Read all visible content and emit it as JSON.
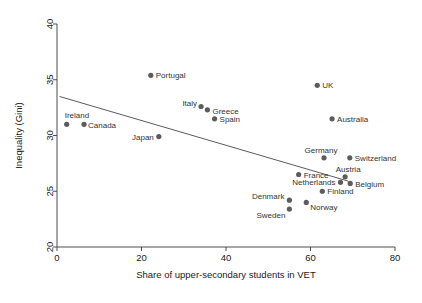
{
  "chart_data": {
    "type": "scatter",
    "title": "",
    "xlabel": "Share of upper-secondary students in VET",
    "ylabel": "Inequality (Gini)",
    "xlim": [
      0,
      80
    ],
    "ylim": [
      20,
      40
    ],
    "xticks": [
      0,
      20,
      40,
      60,
      80
    ],
    "yticks": [
      20,
      25,
      30,
      35,
      40
    ],
    "grid": false,
    "legend": "none",
    "point_color": "#5c5c5c",
    "line_color": "#5a5a5a",
    "trendline": {
      "x1": 0.6,
      "y1": 33.5,
      "x2": 69.0,
      "y2": 25.9
    },
    "points": [
      {
        "name": "Ireland",
        "x": 2.3,
        "y": 31.0,
        "label_dx": -2,
        "label_dy": -6,
        "anchor": "start"
      },
      {
        "name": "Canada",
        "x": 6.4,
        "y": 31.0,
        "label_dx": 4,
        "label_dy": 4,
        "anchor": "start"
      },
      {
        "name": "Portugal",
        "x": 22.2,
        "y": 35.4,
        "label_dx": 5,
        "label_dy": 3,
        "anchor": "start"
      },
      {
        "name": "Japan",
        "x": 24.1,
        "y": 29.9,
        "label_dx": -5,
        "label_dy": 3,
        "anchor": "end"
      },
      {
        "name": "Italy",
        "x": 34.1,
        "y": 32.6,
        "label_dx": -4,
        "label_dy": -1,
        "anchor": "end"
      },
      {
        "name": "Greece",
        "x": 35.6,
        "y": 32.3,
        "label_dx": 5,
        "label_dy": 4,
        "anchor": "start"
      },
      {
        "name": "Spain",
        "x": 37.3,
        "y": 31.5,
        "label_dx": 5,
        "label_dy": 3,
        "anchor": "start"
      },
      {
        "name": "Denmark",
        "x": 55.0,
        "y": 24.2,
        "label_dx": -5,
        "label_dy": -1,
        "anchor": "end"
      },
      {
        "name": "Sweden",
        "x": 55.0,
        "y": 23.4,
        "label_dx": -4,
        "label_dy": 9,
        "anchor": "end"
      },
      {
        "name": "France",
        "x": 57.2,
        "y": 26.5,
        "label_dx": 5,
        "label_dy": 3,
        "anchor": "start"
      },
      {
        "name": "Norway",
        "x": 59.0,
        "y": 24.0,
        "label_dx": 4,
        "label_dy": 8,
        "anchor": "start"
      },
      {
        "name": "UK",
        "x": 61.6,
        "y": 34.5,
        "label_dx": 5,
        "label_dy": 3,
        "anchor": "start"
      },
      {
        "name": "Germany",
        "x": 63.2,
        "y": 28.0,
        "label_dx": -3,
        "label_dy": -5,
        "anchor": "middle"
      },
      {
        "name": "Finland",
        "x": 62.8,
        "y": 25.0,
        "label_dx": 5,
        "label_dy": 3,
        "anchor": "start"
      },
      {
        "name": "Australia",
        "x": 65.1,
        "y": 31.5,
        "label_dx": 5,
        "label_dy": 3,
        "anchor": "start"
      },
      {
        "name": "Netherlands",
        "x": 67.1,
        "y": 25.8,
        "label_dx": -5,
        "label_dy": 3,
        "anchor": "end"
      },
      {
        "name": "Austria",
        "x": 68.2,
        "y": 26.3,
        "label_dx": 3,
        "label_dy": -5,
        "anchor": "middle"
      },
      {
        "name": "Belgium",
        "x": 69.4,
        "y": 25.7,
        "label_dx": 5,
        "label_dy": 4,
        "anchor": "start"
      },
      {
        "name": "Switzerland",
        "x": 69.3,
        "y": 28.0,
        "label_dx": 5,
        "label_dy": 3,
        "anchor": "start"
      }
    ]
  },
  "axes": {
    "x_title": "Share of upper-secondary students in VET",
    "y_title": "Inequality (Gini)",
    "x_tick_labels": [
      "0",
      "20",
      "40",
      "60",
      "80"
    ],
    "y_tick_labels": [
      "20",
      "25",
      "30",
      "35",
      "40"
    ]
  }
}
